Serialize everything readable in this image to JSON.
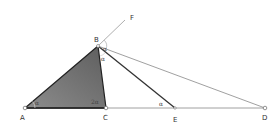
{
  "diagram": {
    "type": "geometry-triangle-construction",
    "points": {
      "A": {
        "label": "A",
        "x": 25,
        "y": 108
      },
      "B": {
        "label": "B",
        "x": 98,
        "y": 46
      },
      "C": {
        "label": "C",
        "x": 106,
        "y": 108
      },
      "E": {
        "label": "E",
        "x": 175,
        "y": 108
      },
      "D": {
        "label": "D",
        "x": 265,
        "y": 108
      },
      "F": {
        "label": "F",
        "x": 125,
        "y": 20
      }
    },
    "angle_labels": {
      "A": "α",
      "C": "2α",
      "B_inner": "α",
      "E": "α",
      "B_outer": "α"
    },
    "colors": {
      "fill": "#7a7a7a",
      "thick_stroke": "#222222",
      "thin_stroke": "#888888",
      "background": "#ffffff"
    }
  }
}
